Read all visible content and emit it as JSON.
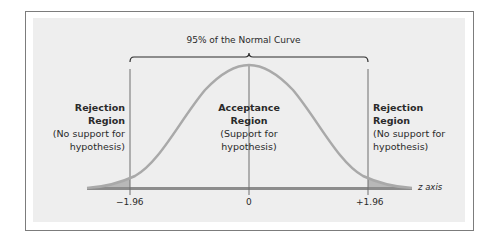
{
  "diagram": {
    "title": "95% of the Normal Curve",
    "regions": {
      "left": {
        "heading_line1": "Rejection",
        "heading_line2": "Region",
        "note_line1": "(No support for",
        "note_line2": "hypothesis)"
      },
      "center": {
        "heading_line1": "Acceptance",
        "heading_line2": "Region",
        "note_line1": "(Support for",
        "note_line2": "hypothesis)"
      },
      "right": {
        "heading_line1": "Rejection",
        "heading_line2": "Region",
        "note_line1": "(No support for",
        "note_line2": "hypothesis)"
      }
    },
    "ticks": [
      "−1.96",
      "0",
      "+1.96"
    ],
    "axis_label": "z axis",
    "colors": {
      "curve": "#a8a8a8",
      "axis": "#8a8a8a",
      "tail_fill": "#b5b5b5",
      "lines": "#6f6f6f",
      "panel": "#eeeeee",
      "border": "#7c7c7c"
    }
  }
}
